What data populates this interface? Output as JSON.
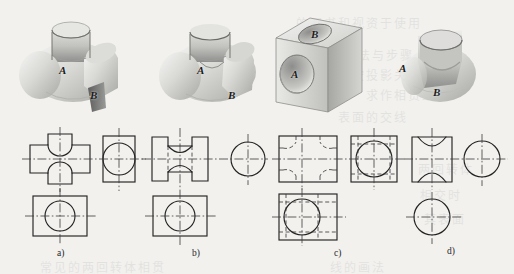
{
  "figure": {
    "kind": "engineering-drawing-plate",
    "background_color": "#f2f1ee",
    "line_color": "#232323",
    "center_line_color": "#3a3a3a"
  },
  "pictorials": [
    {
      "id": "a",
      "name": "two-cylinders-crossing-horizontal-vertical",
      "surface_labels": [
        "A",
        "B"
      ],
      "label_A": "A",
      "label_B": "B"
    },
    {
      "id": "b",
      "name": "cylinder-with-concave-fillet-waist",
      "surface_labels": [
        "A",
        "B"
      ],
      "label_A": "A",
      "label_B": "B"
    },
    {
      "id": "c",
      "name": "cube-with-two-perpendicular-bored-holes",
      "surface_labels": [
        "A",
        "B"
      ],
      "label_A": "A",
      "label_B": "B"
    },
    {
      "id": "d",
      "name": "cylinder-with-large-vertical-bore",
      "surface_labels": [
        "A",
        "B"
      ],
      "label_A": "A",
      "label_B": "B"
    }
  ],
  "captions": [
    {
      "id": "a",
      "text": "a)"
    },
    {
      "id": "b",
      "text": "b)"
    },
    {
      "id": "c",
      "text": "c)"
    },
    {
      "id": "d",
      "text": "d)"
    }
  ],
  "views": {
    "a": {
      "front_view": "cross-shaped outline with two concave arcs (saddle intersection curves) top and bottom",
      "side_view": "square outline with inscribed full circle",
      "top_view": "rectangle outline with inscribed full circle"
    },
    "b": {
      "front_view": "rectangle with two concave arcs forming a waist, hidden dashed edges",
      "side_view": "circle with centerlines, no enclosing square",
      "top_view": "rectangle with inscribed circle"
    },
    "c": {
      "front_view": "square with four dashed corner arcs (hidden hole intersections)",
      "side_view": "square with inscribed circle and dashed lines",
      "top_view": "square with inscribed circle and dashed lines"
    },
    "d": {
      "front_view": "square with concave arcs top and bottom",
      "side_view": "circle with centerlines",
      "top_view": "circle with centerlines"
    }
  },
  "bleed_text": [
    "的图书和视资于使用",
    "的方法与步骤",
    "按投影关系",
    "求作相贯线",
    "表面的交线",
    "两回转体",
    "相交时",
    "其表面",
    "常见的两回转体相贯",
    "线的画法"
  ]
}
